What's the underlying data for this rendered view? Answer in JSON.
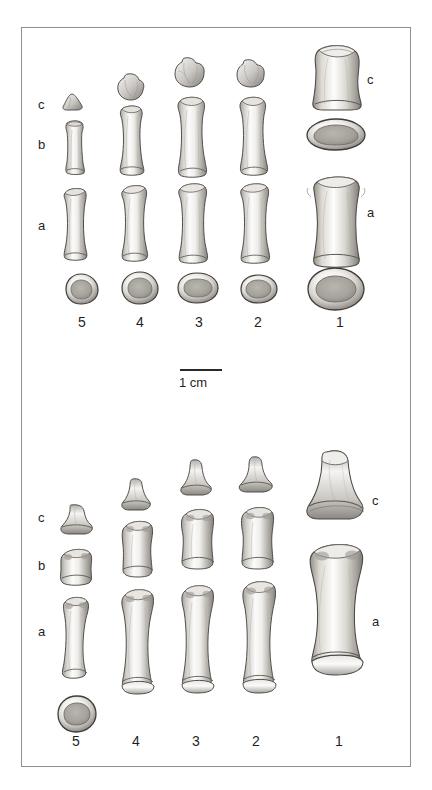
{
  "figure": {
    "background_color": "#ffffff",
    "frame_color": "#8f8f8f",
    "bone_ink": "#3a3a3a",
    "bone_fill_light": "#f3f2f0",
    "bone_fill_mid": "#cfcdc9",
    "bone_fill_dark": "#8e8b86"
  },
  "scale_bar": {
    "caption": "1 cm",
    "length_px": 42,
    "x": 180,
    "y": 369
  },
  "panels": [
    {
      "id": "upper-panel",
      "name": "upper-plate",
      "row_labels_left": [
        {
          "text": "c",
          "x": 38,
          "y": 105
        },
        {
          "text": "b",
          "x": 38,
          "y": 145
        },
        {
          "text": "a",
          "x": 38,
          "y": 226
        }
      ],
      "row_labels_right": [
        {
          "text": "c",
          "x": 367,
          "y": 80
        },
        {
          "text": "a",
          "x": 367,
          "y": 213
        }
      ],
      "digit_numbers": [
        {
          "text": "5",
          "x": 78,
          "y": 323
        },
        {
          "text": "4",
          "x": 136,
          "y": 323
        },
        {
          "text": "3",
          "x": 195,
          "y": 323
        },
        {
          "text": "2",
          "x": 254,
          "y": 323
        },
        {
          "text": "1",
          "x": 336,
          "y": 323
        }
      ],
      "columns": [
        {
          "digit": "5",
          "center_x": 82
        },
        {
          "digit": "4",
          "center_x": 140
        },
        {
          "digit": "3",
          "center_x": 199
        },
        {
          "digit": "2",
          "center_x": 258
        },
        {
          "digit": "1",
          "center_x": 340
        }
      ]
    },
    {
      "id": "lower-panel",
      "name": "lower-plate",
      "row_labels_left": [
        {
          "text": "c",
          "x": 38,
          "y": 518
        },
        {
          "text": "b",
          "x": 38,
          "y": 566
        },
        {
          "text": "a",
          "x": 38,
          "y": 632
        }
      ],
      "row_labels_right": [
        {
          "text": "c",
          "x": 372,
          "y": 501
        },
        {
          "text": "a",
          "x": 372,
          "y": 622
        }
      ],
      "digit_numbers": [
        {
          "text": "5",
          "x": 72,
          "y": 742
        },
        {
          "text": "4",
          "x": 132,
          "y": 742
        },
        {
          "text": "3",
          "x": 192,
          "y": 742
        },
        {
          "text": "2",
          "x": 252,
          "y": 742
        },
        {
          "text": "1",
          "x": 335,
          "y": 742
        }
      ],
      "columns": [
        {
          "digit": "5",
          "center_x": 76
        },
        {
          "digit": "4",
          "center_x": 136
        },
        {
          "digit": "3",
          "center_x": 196
        },
        {
          "digit": "2",
          "center_x": 256
        },
        {
          "digit": "1",
          "center_x": 340
        }
      ]
    }
  ]
}
